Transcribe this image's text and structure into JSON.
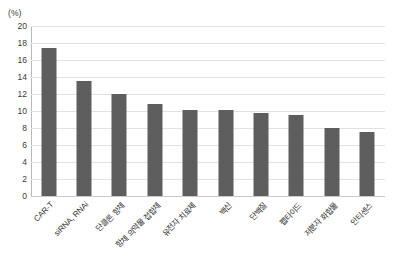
{
  "chart_data": {
    "type": "bar",
    "title": "",
    "subtitle": "",
    "xlabel": "",
    "ylabel": "(%)",
    "unit_caption": "(%)",
    "ylim": [
      0,
      20
    ],
    "ytick_step": 2,
    "yticks": [
      "20",
      "18",
      "16",
      "14",
      "12",
      "10",
      "8",
      "6",
      "4",
      "2",
      "0"
    ],
    "grid": true,
    "legend": "none",
    "bar_color": "#5e5e5e",
    "gridline_color": "#e2e2e2",
    "axis_color": "#b9b9b9",
    "categories": [
      "CAR-T",
      "siRNA, RNAi",
      "단클론 항체",
      "항체 의약물 접합체",
      "유전자 치료제",
      "백신",
      "단백질",
      "펩타이드",
      "저분자 화합물",
      "안티센스"
    ],
    "values": [
      17.4,
      13.5,
      12.0,
      10.8,
      10.1,
      10.1,
      9.8,
      9.5,
      8.0,
      7.5
    ],
    "series": [
      {
        "name": "비중",
        "values": [
          17.4,
          13.5,
          12.0,
          10.8,
          10.1,
          10.1,
          9.8,
          9.5,
          8.0,
          7.5
        ]
      }
    ]
  }
}
